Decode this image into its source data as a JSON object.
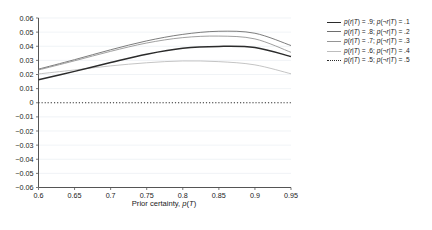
{
  "chart_data": {
    "type": "line",
    "title": "",
    "xlabel": "Prior certainty, p(T)",
    "ylabel": "",
    "xlim": [
      0.6,
      0.95
    ],
    "ylim": [
      -0.06,
      0.06
    ],
    "grid": true,
    "legend_position": "right",
    "x_ticks": [
      "0.6",
      "0.65",
      "0.7",
      "0.75",
      "0.8",
      "0.85",
      "0.9",
      "0.95"
    ],
    "x_tick_values": [
      0.6,
      0.65,
      0.7,
      0.75,
      0.8,
      0.85,
      0.9,
      0.95
    ],
    "y_ticks": [
      "0.06",
      "0.05",
      "0.04",
      "0.03",
      "0.02",
      "0.01",
      "0",
      "-0.01",
      "-0.02",
      "-0.03",
      "-0.04",
      "-0.05",
      "-0.06"
    ],
    "y_tick_values": [
      0.06,
      0.05,
      0.04,
      0.03,
      0.02,
      0.01,
      0,
      -0.01,
      -0.02,
      -0.03,
      -0.04,
      -0.05,
      -0.06
    ],
    "x": [
      0.6,
      0.65,
      0.7,
      0.75,
      0.8,
      0.85,
      0.9,
      0.95
    ],
    "series": [
      {
        "name": "p(r|T) = .9; p(¬r|T) = .1",
        "style": "solid",
        "color": "#2b2b2b",
        "width": 1.5,
        "values": [
          0.0163,
          0.0222,
          0.0285,
          0.0344,
          0.0386,
          0.0399,
          0.0391,
          0.0327
        ]
      },
      {
        "name": "p(r|T) = .8; p(¬r|T) = .2",
        "style": "solid",
        "color": "#6e6e6e",
        "width": 0.9,
        "values": [
          0.0238,
          0.0305,
          0.0375,
          0.0438,
          0.0484,
          0.0506,
          0.0492,
          0.0405
        ]
      },
      {
        "name": "p(r|T) = .7; p(¬r|T) = .3",
        "style": "solid",
        "color": "#959595",
        "width": 0.9,
        "values": [
          0.0232,
          0.0297,
          0.0364,
          0.0423,
          0.0461,
          0.0472,
          0.0452,
          0.0357
        ]
      },
      {
        "name": "p(r|T) = .6; p(¬r|T) = .4",
        "style": "solid",
        "color": "#bdbdbd",
        "width": 0.9,
        "values": [
          0.0204,
          0.0232,
          0.0261,
          0.0283,
          0.0296,
          0.0291,
          0.0268,
          0.0205
        ]
      },
      {
        "name": "p(r|T) = .5; p(¬r|T) = .5",
        "style": "dotted",
        "color": "#2b2b2b",
        "width": 1.2,
        "values": [
          0,
          0,
          0,
          0,
          0,
          0,
          0,
          0
        ]
      }
    ]
  },
  "legend": {
    "items": [
      {
        "label": "p(r|T) = .9; p(¬r|T) = .1"
      },
      {
        "label": "p(r|T) = .8; p(¬r|T) = .2"
      },
      {
        "label": "p(r|T) = .7; p(¬r|T) = .3"
      },
      {
        "label": "p(r|T) = .6; p(¬r|T) = .4"
      },
      {
        "label": "p(r|T) = .5; p(¬r|T) = .5"
      }
    ]
  },
  "axis": {
    "x_title_prefix": "Prior certainty, ",
    "x_title_p": "p",
    "x_title_open": "(",
    "x_title_t": "T",
    "x_title_close": ")"
  }
}
